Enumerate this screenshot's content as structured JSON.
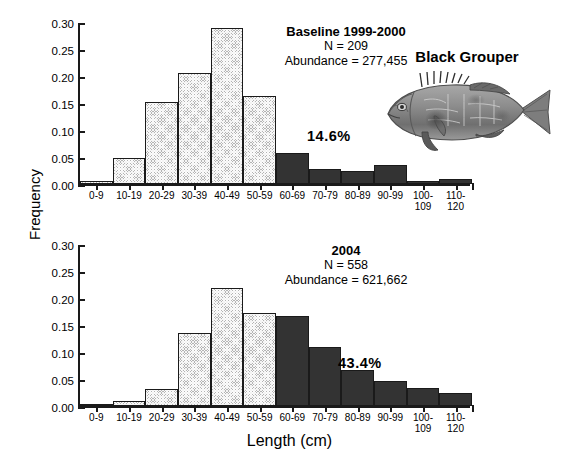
{
  "axes": {
    "ylabel": "Frequency",
    "xlabel": "Length (cm)",
    "yticks": [
      "0.00",
      "0.05",
      "0.10",
      "0.15",
      "0.20",
      "0.25",
      "0.30"
    ],
    "xticklabels": [
      "0-9",
      "10-19",
      "20-29",
      "30-39",
      "40-49",
      "50-59",
      "60-69",
      "70-79",
      "80-89",
      "90-99",
      "100-\n109",
      "110-\n120"
    ]
  },
  "fish": {
    "caption": "Black Grouper",
    "icon": "fish-illustration"
  },
  "panels": [
    {
      "id": "top",
      "title": "Baseline 1999-2000",
      "n_label": "N = 209",
      "abundance_label": "Abundance = 277,455",
      "percent_label": "14.6%"
    },
    {
      "id": "bottom",
      "title": "2004",
      "n_label": "N = 558",
      "abundance_label": "Abundance = 621,662",
      "percent_label": "43.4%"
    }
  ],
  "colors": {
    "light_bar": "#b4b4b4",
    "dark_bar": "#333333",
    "axis": "#1a1a1a"
  },
  "chart_data": [
    {
      "type": "bar",
      "title": "Baseline 1999-2000",
      "subtitle": "N = 209 | Abundance = 277,455",
      "xlabel": "Length (cm)",
      "ylabel": "Frequency",
      "ylim": [
        0,
        0.3
      ],
      "yticks": [
        0.0,
        0.05,
        0.1,
        0.15,
        0.2,
        0.25,
        0.3
      ],
      "grid": false,
      "legend": "none",
      "annotation": "14.6%",
      "categories": [
        "0-9",
        "10-19",
        "20-29",
        "30-39",
        "40-49",
        "50-59",
        "60-69",
        "70-79",
        "80-89",
        "90-99",
        "100-109",
        "110-120"
      ],
      "values": [
        0.005,
        0.048,
        0.152,
        0.206,
        0.288,
        0.163,
        0.057,
        0.027,
        0.025,
        0.035,
        0.005,
        0.01
      ],
      "bar_shading": [
        "light",
        "light",
        "light",
        "light",
        "light",
        "light",
        "dark",
        "dark",
        "dark",
        "dark",
        "dark",
        "dark"
      ]
    },
    {
      "type": "bar",
      "title": "2004",
      "subtitle": "N = 558 | Abundance = 621,662",
      "xlabel": "Length (cm)",
      "ylabel": "Frequency",
      "ylim": [
        0,
        0.3
      ],
      "yticks": [
        0.0,
        0.05,
        0.1,
        0.15,
        0.2,
        0.25,
        0.3
      ],
      "grid": false,
      "legend": "none",
      "annotation": "43.4%",
      "categories": [
        "0-9",
        "10-19",
        "20-29",
        "30-39",
        "40-49",
        "50-59",
        "60-69",
        "70-79",
        "80-89",
        "90-99",
        "100-109",
        "110-120"
      ],
      "values": [
        0.0,
        0.009,
        0.032,
        0.136,
        0.219,
        0.173,
        0.166,
        0.11,
        0.067,
        0.047,
        0.034,
        0.025
      ],
      "bar_shading": [
        "light",
        "light",
        "light",
        "light",
        "light",
        "light",
        "dark",
        "dark",
        "dark",
        "dark",
        "dark",
        "dark"
      ]
    }
  ]
}
